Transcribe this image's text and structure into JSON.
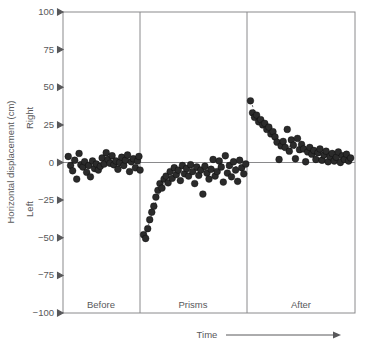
{
  "chart_data": {
    "type": "scatter",
    "title": "",
    "xlabel": "Time",
    "ylabel": "Horizontal displacement (cm)",
    "ylim": [
      -100,
      100
    ],
    "yticks": [
      100,
      75,
      50,
      25,
      0,
      -25,
      -50,
      -75,
      -100
    ],
    "ytick_labels": [
      "100",
      "75",
      "50",
      "25",
      "0",
      "−25",
      "−50",
      "−75",
      "−100"
    ],
    "y_direction_labels": {
      "positive": "Right",
      "negative": "Left"
    },
    "grid": false,
    "legend": null,
    "x_axis_arrow": true,
    "phases": [
      {
        "name": "Before",
        "label": "Before",
        "x_start": 0.0,
        "x_end": 0.268
      },
      {
        "name": "Prisms",
        "label": "Prisms",
        "x_start": 0.268,
        "x_end": 0.635
      },
      {
        "name": "After",
        "label": "After",
        "x_start": 0.635,
        "x_end": 1.0
      }
    ],
    "series": [
      {
        "name": "Before",
        "marker": "circle",
        "color": "#2b2b2b",
        "points": [
          [
            0.018,
            4.0
          ],
          [
            0.026,
            -2.0
          ],
          [
            0.033,
            -5.5
          ],
          [
            0.04,
            1.5
          ],
          [
            0.047,
            -11.0
          ],
          [
            0.055,
            6.0
          ],
          [
            0.061,
            -1.5
          ],
          [
            0.068,
            -3.0
          ],
          [
            0.074,
            0.5
          ],
          [
            0.081,
            -6.5
          ],
          [
            0.088,
            -2.0
          ],
          [
            0.094,
            -9.5
          ],
          [
            0.101,
            1.0
          ],
          [
            0.108,
            -4.0
          ],
          [
            0.114,
            -1.0
          ],
          [
            0.121,
            -5.0
          ],
          [
            0.128,
            -2.5
          ],
          [
            0.134,
            3.0
          ],
          [
            0.141,
            -1.0
          ],
          [
            0.148,
            6.5
          ],
          [
            0.154,
            2.0
          ],
          [
            0.161,
            -0.5
          ],
          [
            0.168,
            4.5
          ],
          [
            0.174,
            -1.5
          ],
          [
            0.181,
            1.0
          ],
          [
            0.188,
            -4.5
          ],
          [
            0.194,
            0.0
          ],
          [
            0.201,
            3.5
          ],
          [
            0.208,
            -2.0
          ],
          [
            0.214,
            1.5
          ],
          [
            0.221,
            5.0
          ],
          [
            0.228,
            -6.0
          ],
          [
            0.234,
            0.5
          ],
          [
            0.241,
            2.5
          ],
          [
            0.248,
            -3.5
          ],
          [
            0.255,
            1.0
          ],
          [
            0.26,
            4.0
          ],
          [
            0.264,
            -5.0
          ]
        ]
      },
      {
        "name": "Prisms",
        "marker": "circle",
        "color": "#444444",
        "points": [
          [
            0.276,
            -48.0
          ],
          [
            0.283,
            -50.5
          ],
          [
            0.29,
            -44.0
          ],
          [
            0.297,
            -38.0
          ],
          [
            0.304,
            -33.0
          ],
          [
            0.311,
            -29.0
          ],
          [
            0.318,
            -23.0
          ],
          [
            0.325,
            -18.5
          ],
          [
            0.332,
            -14.0
          ],
          [
            0.339,
            -17.0
          ],
          [
            0.346,
            -11.0
          ],
          [
            0.353,
            -9.0
          ],
          [
            0.36,
            -13.5
          ],
          [
            0.367,
            -6.0
          ],
          [
            0.374,
            -10.5
          ],
          [
            0.381,
            -3.5
          ],
          [
            0.388,
            -8.0
          ],
          [
            0.395,
            -5.0
          ],
          [
            0.402,
            -12.0
          ],
          [
            0.409,
            -2.0
          ],
          [
            0.416,
            -7.5
          ],
          [
            0.423,
            -4.0
          ],
          [
            0.43,
            -9.0
          ],
          [
            0.437,
            -1.5
          ],
          [
            0.444,
            -6.0
          ],
          [
            0.451,
            -14.0
          ],
          [
            0.458,
            -3.0
          ],
          [
            0.465,
            -8.5
          ],
          [
            0.472,
            -5.0
          ],
          [
            0.479,
            -21.0
          ],
          [
            0.486,
            -2.5
          ],
          [
            0.493,
            -7.0
          ],
          [
            0.5,
            -11.0
          ],
          [
            0.507,
            -4.5
          ],
          [
            0.514,
            2.0
          ],
          [
            0.521,
            -9.0
          ],
          [
            0.528,
            -6.0
          ],
          [
            0.535,
            1.0
          ],
          [
            0.542,
            -3.0
          ],
          [
            0.549,
            -13.0
          ],
          [
            0.556,
            4.5
          ],
          [
            0.563,
            -7.0
          ],
          [
            0.57,
            -2.0
          ],
          [
            0.577,
            -9.5
          ],
          [
            0.584,
            0.5
          ],
          [
            0.591,
            -5.0
          ],
          [
            0.598,
            -12.5
          ],
          [
            0.605,
            1.5
          ],
          [
            0.612,
            -3.5
          ],
          [
            0.619,
            -7.5
          ],
          [
            0.626,
            -1.0
          ]
        ]
      },
      {
        "name": "After",
        "marker": "circle",
        "color": "#2b2b2b",
        "points": [
          [
            0.642,
            41.0
          ],
          [
            0.649,
            33.0
          ],
          [
            0.656,
            30.0
          ],
          [
            0.663,
            31.5
          ],
          [
            0.67,
            27.0
          ],
          [
            0.677,
            28.5
          ],
          [
            0.684,
            25.0
          ],
          [
            0.691,
            26.0
          ],
          [
            0.698,
            22.0
          ],
          [
            0.705,
            23.5
          ],
          [
            0.712,
            19.0
          ],
          [
            0.719,
            20.5
          ],
          [
            0.726,
            17.0
          ],
          [
            0.733,
            13.5
          ],
          [
            0.74,
            2.0
          ],
          [
            0.747,
            11.0
          ],
          [
            0.754,
            14.0
          ],
          [
            0.761,
            10.0
          ],
          [
            0.768,
            22.0
          ],
          [
            0.775,
            7.5
          ],
          [
            0.782,
            15.0
          ],
          [
            0.789,
            11.5
          ],
          [
            0.796,
            2.5
          ],
          [
            0.803,
            16.0
          ],
          [
            0.81,
            8.5
          ],
          [
            0.817,
            12.0
          ],
          [
            0.824,
            9.0
          ],
          [
            0.831,
            0.5
          ],
          [
            0.838,
            7.0
          ],
          [
            0.845,
            10.0
          ],
          [
            0.852,
            5.5
          ],
          [
            0.859,
            8.0
          ],
          [
            0.866,
            2.0
          ],
          [
            0.873,
            6.5
          ],
          [
            0.88,
            9.0
          ],
          [
            0.887,
            1.5
          ],
          [
            0.894,
            5.0
          ],
          [
            0.901,
            7.5
          ],
          [
            0.908,
            0.5
          ],
          [
            0.915,
            4.0
          ],
          [
            0.922,
            6.0
          ],
          [
            0.929,
            1.0
          ],
          [
            0.936,
            3.5
          ],
          [
            0.943,
            7.0
          ],
          [
            0.95,
            0.0
          ],
          [
            0.957,
            4.5
          ],
          [
            0.964,
            2.0
          ],
          [
            0.971,
            5.5
          ],
          [
            0.978,
            1.0
          ],
          [
            0.985,
            3.0
          ]
        ]
      }
    ],
    "trend_curves": [
      {
        "name": "prisms-adaptation-curve",
        "style": "dashed",
        "points": [
          [
            0.278,
            -50.0
          ],
          [
            0.292,
            -42.0
          ],
          [
            0.306,
            -33.0
          ],
          [
            0.32,
            -25.0
          ],
          [
            0.336,
            -18.0
          ],
          [
            0.354,
            -13.0
          ],
          [
            0.375,
            -9.5
          ],
          [
            0.4,
            -7.5
          ],
          [
            0.43,
            -6.0
          ],
          [
            0.47,
            -5.0
          ],
          [
            0.52,
            -4.0
          ],
          [
            0.57,
            -3.0
          ],
          [
            0.62,
            -2.5
          ]
        ]
      },
      {
        "name": "after-effect-curve",
        "style": "dashed",
        "points": [
          [
            0.644,
            41.0
          ],
          [
            0.656,
            33.0
          ],
          [
            0.67,
            28.0
          ],
          [
            0.686,
            24.0
          ],
          [
            0.704,
            20.0
          ],
          [
            0.724,
            16.0
          ],
          [
            0.748,
            13.0
          ],
          [
            0.778,
            10.5
          ],
          [
            0.812,
            8.0
          ],
          [
            0.852,
            6.0
          ],
          [
            0.896,
            4.0
          ],
          [
            0.94,
            2.5
          ],
          [
            0.985,
            1.5
          ]
        ]
      }
    ]
  },
  "axes": {
    "y_axis_title": "Horizontal displacement (cm)",
    "y_positive_label": "Right",
    "y_negative_label": "Left",
    "x_axis_title": "Time"
  },
  "ticks": {
    "y": [
      "100",
      "75",
      "50",
      "25",
      "0",
      "−25",
      "−50",
      "−75",
      "−100"
    ]
  },
  "phase_labels": {
    "before": "Before",
    "prisms": "Prisms",
    "after": "After"
  },
  "colors": {
    "marker": "#2b2b2b",
    "frame": "#8a8a8c",
    "text": "#58585a",
    "background": "#ffffff"
  }
}
